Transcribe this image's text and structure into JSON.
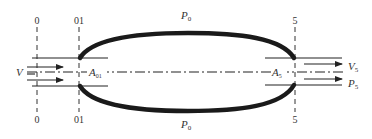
{
  "diagram": {
    "type": "engine-flow-control-volume",
    "colors": {
      "ink": "#222222",
      "background": "#ffffff"
    },
    "stations": [
      {
        "id": "0",
        "top_label": "0",
        "bottom_label": "0"
      },
      {
        "id": "01",
        "top_label": "01",
        "bottom_label": "01"
      },
      {
        "id": "5",
        "top_label": "5",
        "bottom_label": "5"
      }
    ],
    "labels": {
      "ambient_top": {
        "main": "P",
        "sub": "0"
      },
      "ambient_bottom": {
        "main": "P",
        "sub": "0"
      },
      "inlet_velocity": {
        "main": "V",
        "sub": ""
      },
      "inlet_area": {
        "main": "A",
        "sub": "01"
      },
      "exit_area": {
        "main": "A",
        "sub": "5"
      },
      "exit_velocity": {
        "main": "V",
        "sub": "5"
      },
      "exit_pressure": {
        "main": "P",
        "sub": "5"
      }
    }
  }
}
